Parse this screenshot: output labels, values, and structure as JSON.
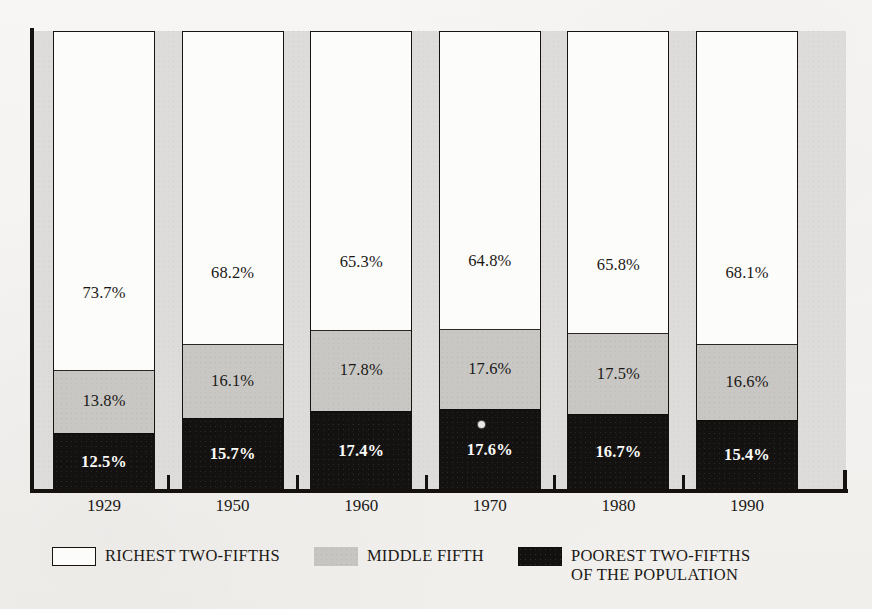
{
  "chart_data": {
    "type": "bar",
    "subtype": "stacked-bar-100-percent",
    "title": "",
    "subtitle": "",
    "xlabel": "",
    "ylabel": "",
    "ylim": [
      0,
      100
    ],
    "grid": false,
    "legend_position": "bottom-left",
    "categories": [
      "1929",
      "1950",
      "1960",
      "1970",
      "1980",
      "1990"
    ],
    "series": [
      {
        "name": "RICHEST TWO-FIFTHS",
        "color": "#fcfcfb",
        "values": [
          73.7,
          68.2,
          65.3,
          64.8,
          65.8,
          68.1
        ],
        "labels": [
          "73.7%",
          "68.2%",
          "65.3%",
          "64.8%",
          "65.8%",
          "68.1%"
        ]
      },
      {
        "name": "MIDDLE FIFTH",
        "color": "#c8c7c4",
        "values": [
          13.8,
          16.1,
          17.8,
          17.6,
          17.5,
          16.6
        ],
        "labels": [
          "13.8%",
          "16.1%",
          "17.8%",
          "17.6%",
          "17.5%",
          "16.6%"
        ]
      },
      {
        "name": "POOREST TWO-FIFTHS",
        "color": "#141210",
        "values": [
          12.5,
          15.7,
          17.4,
          17.6,
          16.7,
          15.4
        ],
        "labels": [
          "12.5%",
          "15.7%",
          "17.4%",
          "17.6%",
          "16.7%",
          "15.4%"
        ]
      }
    ]
  },
  "axis": {
    "years": [
      "1929",
      "1950",
      "1960",
      "1970",
      "1980",
      "1990"
    ]
  },
  "bars": [
    {
      "year": "1929",
      "top_label": "73.7%",
      "mid_label": "13.8%",
      "bot_label": "12.5%",
      "top_value": 73.7,
      "mid_value": 13.8,
      "bot_value": 12.5
    },
    {
      "year": "1950",
      "top_label": "68.2%",
      "mid_label": "16.1%",
      "bot_label": "15.7%",
      "top_value": 68.2,
      "mid_value": 16.1,
      "bot_value": 15.7
    },
    {
      "year": "1960",
      "top_label": "65.3%",
      "mid_label": "17.8%",
      "bot_label": "17.4%",
      "top_value": 65.3,
      "mid_value": 17.8,
      "bot_value": 17.4
    },
    {
      "year": "1970",
      "top_label": "64.8%",
      "mid_label": "17.6%",
      "bot_label": "17.6%",
      "top_value": 64.8,
      "mid_value": 17.6,
      "bot_value": 17.6
    },
    {
      "year": "1980",
      "top_label": "65.8%",
      "mid_label": "17.5%",
      "bot_label": "16.7%",
      "top_value": 65.8,
      "mid_value": 17.5,
      "bot_value": 16.7
    },
    {
      "year": "1990",
      "top_label": "68.1%",
      "mid_label": "16.6%",
      "bot_label": "15.4%",
      "top_value": 68.1,
      "mid_value": 16.6,
      "bot_value": 15.4
    }
  ],
  "legend": {
    "items": [
      {
        "label": "RICHEST TWO-FIFTHS",
        "label_line2": "",
        "swatch": "white-outlined-square"
      },
      {
        "label": "MIDDLE FIFTH",
        "label_line2": "",
        "swatch": "gray-square"
      },
      {
        "label": "POOREST TWO-FIFTHS",
        "label_line2": "OF THE POPULATION",
        "swatch": "black-square"
      }
    ]
  },
  "colors": {
    "plot_background": "#dddcda",
    "page_background": "#f5f4f2",
    "richest": "#fcfcfb",
    "middle": "#c8c7c4",
    "poorest": "#141210",
    "axis": "#14110f",
    "text": "#1c1916"
  }
}
